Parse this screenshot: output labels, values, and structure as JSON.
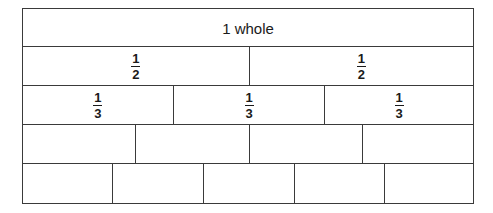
{
  "diagram": {
    "rows": [
      {
        "parts": 1,
        "cells": [
          {
            "label": "1 whole"
          }
        ]
      },
      {
        "parts": 2,
        "cells": [
          {
            "num": "1",
            "den": "2"
          },
          {
            "num": "1",
            "den": "2"
          }
        ]
      },
      {
        "parts": 3,
        "cells": [
          {
            "num": "1",
            "den": "3"
          },
          {
            "num": "1",
            "den": "3"
          },
          {
            "num": "1",
            "den": "3"
          }
        ]
      },
      {
        "parts": 4,
        "cells": [
          {},
          {},
          {},
          {}
        ]
      },
      {
        "parts": 5,
        "cells": [
          {},
          {},
          {},
          {},
          {}
        ]
      }
    ],
    "colors": {
      "line": "#3a3a3a",
      "background": "#ffffff",
      "text": "#1a1a1a"
    }
  }
}
